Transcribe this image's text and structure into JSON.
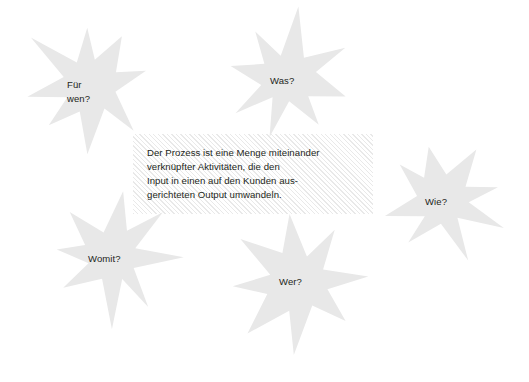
{
  "diagram": {
    "background_color": "#ffffff",
    "star_fill_color": "#e8e8e8",
    "text_color": "#231f20",
    "hatch_color": "#e9e9e9"
  },
  "stars": [
    {
      "id": "fuer-wen",
      "label": "Für\nwen?",
      "points": 8,
      "cx": 88,
      "cy": 85,
      "outer_radius": 66,
      "inner_radius": 27,
      "rotation": -8,
      "label_x": 67,
      "label_y": 78
    },
    {
      "id": "was",
      "label": "Was?",
      "points": 8,
      "cx": 287,
      "cy": 78,
      "outer_radius": 63,
      "inner_radius": 26,
      "rotation": 12,
      "label_x": 270,
      "label_y": 74
    },
    {
      "id": "wie",
      "label": "Wie?",
      "points": 8,
      "cx": 443,
      "cy": 200,
      "outer_radius": 62,
      "inner_radius": 26,
      "rotation": -14,
      "label_x": 425,
      "label_y": 195
    },
    {
      "id": "womit",
      "label": "Womit?",
      "points": 8,
      "cx": 113,
      "cy": 257,
      "outer_radius": 65,
      "inner_radius": 27,
      "rotation": 6,
      "label_x": 88,
      "label_y": 252
    },
    {
      "id": "wer",
      "label": "Wer?",
      "points": 8,
      "cx": 297,
      "cy": 281,
      "outer_radius": 72,
      "inner_radius": 29,
      "rotation": -5,
      "label_x": 279,
      "label_y": 275
    }
  ],
  "definition": {
    "text": "Der Prozess ist eine Menge miteinander\nverknüpfter Aktivitäten, die den\nInput in einen auf den Kunden aus-\ngerichteten Output umwandeln.",
    "box_x": 133,
    "box_y": 134,
    "box_width": 240,
    "box_height": 80
  }
}
